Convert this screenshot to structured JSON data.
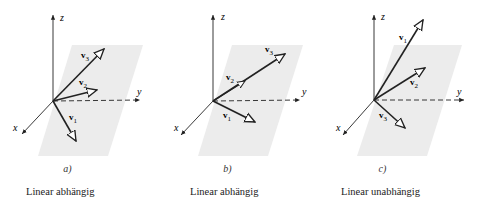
{
  "figure": {
    "panels": [
      {
        "id": "a",
        "caption": "a)",
        "verdict": "Linear abhängig",
        "axes": {
          "x": "x",
          "y": "y",
          "z": "z"
        },
        "vectors": [
          {
            "label": "v",
            "sub": "1"
          },
          {
            "label": "v",
            "sub": "2"
          },
          {
            "label": "v",
            "sub": "3"
          }
        ]
      },
      {
        "id": "b",
        "caption": "b)",
        "verdict": "Linear abhängig",
        "axes": {
          "x": "x",
          "y": "y",
          "z": "z"
        },
        "vectors": [
          {
            "label": "v",
            "sub": "1"
          },
          {
            "label": "v",
            "sub": "2"
          },
          {
            "label": "v",
            "sub": "3"
          }
        ]
      },
      {
        "id": "c",
        "caption": "c)",
        "verdict": "Linear unabhängig",
        "axes": {
          "x": "x",
          "y": "y",
          "z": "z"
        },
        "vectors": [
          {
            "label": "v",
            "sub": "1"
          },
          {
            "label": "v",
            "sub": "2"
          },
          {
            "label": "v",
            "sub": "3"
          }
        ]
      }
    ],
    "colors": {
      "plane": "#ececec",
      "ink": "#222222"
    }
  }
}
